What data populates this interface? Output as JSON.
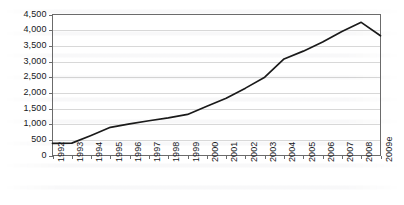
{
  "chart_data": {
    "type": "line",
    "title": "",
    "subtitle": "",
    "xlabel": "",
    "ylabel": "",
    "categories": [
      "1992",
      "1993",
      "1994",
      "1995",
      "1996",
      "1997",
      "1998",
      "1999",
      "2000",
      "2001",
      "2002",
      "2003",
      "2004",
      "2005",
      "2006",
      "2007",
      "2008",
      "2009e"
    ],
    "values": [
      390,
      395,
      640,
      900,
      1010,
      1110,
      1200,
      1310,
      1570,
      1830,
      2150,
      2500,
      3080,
      3330,
      3620,
      3960,
      4250,
      3820
    ],
    "series": [
      {
        "name": "",
        "values": [
          390,
          395,
          640,
          900,
          1010,
          1110,
          1200,
          1310,
          1570,
          1830,
          2150,
          2500,
          3080,
          3330,
          3620,
          3960,
          4250,
          3820
        ]
      }
    ],
    "ylim": [
      0,
      4500
    ],
    "yticks": [
      0,
      500,
      1000,
      1500,
      2000,
      2500,
      3000,
      3500,
      4000,
      4500
    ],
    "ytick_labels": [
      "0",
      "500",
      "1,000",
      "1,500",
      "2,000",
      "2,500",
      "3,000",
      "3,500",
      "4,000",
      "4,500"
    ],
    "xtick_labels": [
      "1992",
      "1993",
      "1994",
      "1995",
      "1996",
      "1997",
      "1998",
      "1999",
      "2000",
      "2001",
      "2002",
      "2003",
      "2004",
      "2005",
      "2006",
      "2007",
      "2008",
      "2009e"
    ],
    "grid": true,
    "grid_axis": "y",
    "legend": false,
    "legend_position": "none",
    "annotations": [],
    "line_color": "#1a1a1a",
    "grid_color": "#d8d8d8",
    "axis_color": "#6b6b6b",
    "plot_background": "#ffffff"
  },
  "axes": {
    "x_rotation_deg": -90
  }
}
